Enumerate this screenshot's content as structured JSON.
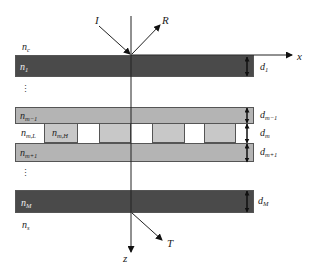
{
  "diagram": {
    "type": "multilayer-grating-structure",
    "colors": {
      "dark_layer": "#4a4a4a",
      "light_layer": "#b4b4b4",
      "grating_high": "#c8c8c8",
      "grating_low": "#ffffff",
      "axis": "#222222"
    },
    "axes": {
      "x_label": "x",
      "z_label": "z"
    },
    "beams": {
      "incident": "I",
      "reflected": "R",
      "transmitted": "T"
    },
    "regions": {
      "cover": {
        "base": "n",
        "sub": "c"
      },
      "substrate": {
        "base": "n",
        "sub": "s"
      }
    },
    "layers": [
      {
        "name": "n",
        "sub": "1",
        "thickness": "d",
        "thickness_sub": "1",
        "shade": "dark"
      },
      {
        "name": "n",
        "sub": "m−1",
        "thickness": "d",
        "thickness_sub": "m−1",
        "shade": "light"
      },
      {
        "name": "grating",
        "thickness": "d",
        "thickness_sub": "m",
        "low_label": {
          "base": "n",
          "sub": "m,L"
        },
        "high_label": {
          "base": "n",
          "sub": "m,H"
        }
      },
      {
        "name": "n",
        "sub": "m+1",
        "thickness": "d",
        "thickness_sub": "m+1",
        "shade": "light"
      },
      {
        "name": "n",
        "sub": "M",
        "thickness": "d",
        "thickness_sub": "M",
        "shade": "dark"
      }
    ],
    "ellipsis": "⋮"
  }
}
